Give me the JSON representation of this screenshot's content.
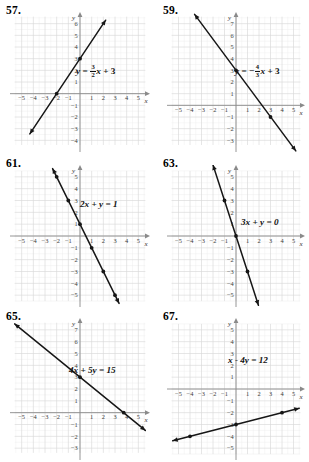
{
  "page": {
    "width": 309,
    "height": 462,
    "background": "#ffffff",
    "axis_label_x": "x",
    "axis_label_y": "y",
    "grid_color": "#d8d8d8",
    "subgrid_color": "#ececec",
    "axis_color": "#8a8a8a",
    "line_color": "#161616",
    "tick_label_color": "#3a3a3a"
  },
  "problems": [
    {
      "number": "57.",
      "equation_plain": "y = 3/2 x + 3",
      "equation_parts": {
        "lhs": "y",
        "eq": "=",
        "coef_num": "3",
        "coef_den": "2",
        "var": "x",
        "op": "+",
        "const": "3"
      },
      "chart_data": {
        "type": "line",
        "title": "y = 3/2x + 3",
        "xlabel": "x",
        "ylabel": "y",
        "xlim": [
          -6,
          6
        ],
        "ylim": [
          -5,
          7
        ],
        "xticks": [
          -5,
          -4,
          -3,
          -2,
          -1,
          1,
          2,
          3,
          4,
          5
        ],
        "yticks": [
          -4,
          -3,
          -2,
          -1,
          1,
          2,
          3,
          4,
          5,
          6
        ],
        "grid": true,
        "slope": 1.5,
        "intercept": 3,
        "points": [
          [
            -2,
            0
          ],
          [
            0,
            3
          ]
        ],
        "segment": [
          [
            -4.3,
            -3.45
          ],
          [
            2.2,
            6.3
          ]
        ],
        "arrows": "both"
      }
    },
    {
      "number": "59.",
      "equation_plain": "y = -4/3 x + 3",
      "equation_parts": {
        "lhs": "y",
        "eq": "=",
        "sign": "−",
        "coef_num": "4",
        "coef_den": "3",
        "var": "x",
        "op": "+",
        "const": "3"
      },
      "chart_data": {
        "type": "line",
        "title": "y = -4/3x + 3",
        "xlabel": "x",
        "ylabel": "y",
        "xlim": [
          -6,
          6
        ],
        "ylim": [
          -4,
          8
        ],
        "xticks": [
          -5,
          -4,
          -3,
          -2,
          -1,
          1,
          2,
          3,
          4,
          5
        ],
        "yticks": [
          -3,
          -2,
          -1,
          1,
          2,
          3,
          4,
          5,
          6,
          7
        ],
        "grid": true,
        "slope": -1.3333,
        "intercept": 3,
        "points": [
          [
            0,
            3
          ],
          [
            3,
            -1
          ]
        ],
        "segment": [
          [
            -3.6,
            7.8
          ],
          [
            5.2,
            -3.9
          ]
        ],
        "arrows": "both"
      }
    },
    {
      "number": "61.",
      "equation_plain": "2x + y = 1",
      "equation_parts": {
        "a": "2",
        "var1": "x",
        "op": "+",
        "var2": "y",
        "eq": "=",
        "rhs": "1"
      },
      "chart_data": {
        "type": "line",
        "title": "2x + y = 1",
        "xlabel": "x",
        "ylabel": "y",
        "xlim": [
          -6,
          6
        ],
        "ylim": [
          -6,
          6
        ],
        "xticks": [
          -5,
          -4,
          -3,
          -2,
          -1,
          1,
          2,
          3,
          4,
          5
        ],
        "yticks": [
          -5,
          -4,
          -3,
          -2,
          -1,
          1,
          2,
          3,
          4,
          5
        ],
        "grid": true,
        "slope": -2,
        "intercept": 1,
        "points": [
          [
            -2,
            5
          ],
          [
            -1,
            3
          ],
          [
            0,
            1
          ],
          [
            1,
            -1
          ],
          [
            2,
            -3
          ],
          [
            3,
            -5
          ]
        ],
        "segment": [
          [
            -2.35,
            5.7
          ],
          [
            3.35,
            -5.7
          ]
        ],
        "arrows": "both"
      }
    },
    {
      "number": "63.",
      "equation_plain": "3x + y = 0",
      "equation_parts": {
        "a": "3",
        "var1": "x",
        "op": "+",
        "var2": "y",
        "eq": "=",
        "rhs": "0"
      },
      "chart_data": {
        "type": "line",
        "title": "3x + y = 0",
        "xlabel": "x",
        "ylabel": "y",
        "xlim": [
          -6,
          6
        ],
        "ylim": [
          -6,
          6
        ],
        "xticks": [
          -5,
          -4,
          -3,
          -2,
          -1,
          1,
          2,
          3,
          4,
          5
        ],
        "yticks": [
          -5,
          -4,
          -3,
          -2,
          -1,
          1,
          2,
          3,
          4,
          5
        ],
        "grid": true,
        "slope": -3,
        "intercept": 0,
        "points": [
          [
            -1,
            3
          ],
          [
            0,
            0
          ],
          [
            1,
            -3
          ]
        ],
        "segment": [
          [
            -2.0,
            6.0
          ],
          [
            1.95,
            -5.85
          ]
        ],
        "arrows": "both"
      }
    },
    {
      "number": "65.",
      "equation_plain": "4x + 5y = 15",
      "equation_parts": {
        "a": "4",
        "var1": "x",
        "op": "+",
        "b": "5",
        "var2": "y",
        "eq": "=",
        "rhs": "15"
      },
      "chart_data": {
        "type": "line",
        "title": "4x + 5y = 15",
        "xlabel": "x",
        "ylabel": "y",
        "xlim": [
          -6,
          6
        ],
        "ylim": [
          -4,
          8
        ],
        "xticks": [
          -5,
          -4,
          -3,
          -2,
          -1,
          1,
          2,
          3,
          4,
          5
        ],
        "yticks": [
          -3,
          -2,
          -1,
          1,
          2,
          3,
          4,
          5,
          6,
          7
        ],
        "grid": true,
        "slope": -0.8,
        "intercept": 3,
        "points": [
          [
            0,
            3
          ],
          [
            3.75,
            0
          ]
        ],
        "segment": [
          [
            -5.6,
            7.5
          ],
          [
            5.6,
            -1.5
          ]
        ],
        "arrows": "both"
      }
    },
    {
      "number": "67.",
      "equation_plain": "x - 4y = 12",
      "equation_parts": {
        "var1": "x",
        "op": "−",
        "b": "4",
        "var2": "y",
        "eq": "=",
        "rhs": "12"
      },
      "chart_data": {
        "type": "line",
        "title": "x - 4y = 12",
        "xlabel": "x",
        "ylabel": "y",
        "xlim": [
          -6,
          6
        ],
        "ylim": [
          -6,
          6
        ],
        "xticks": [
          -5,
          -4,
          -3,
          -2,
          -1,
          1,
          2,
          3,
          4,
          5
        ],
        "yticks": [
          -5,
          -4,
          -3,
          -2,
          -1,
          1,
          2,
          3,
          4,
          5
        ],
        "grid": true,
        "slope": 0.25,
        "intercept": -3,
        "points": [
          [
            -4,
            -4
          ],
          [
            0,
            -3
          ],
          [
            4,
            -2
          ]
        ],
        "segment": [
          [
            -5.5,
            -4.38
          ],
          [
            5.5,
            -1.63
          ]
        ],
        "arrows": "both"
      }
    }
  ]
}
